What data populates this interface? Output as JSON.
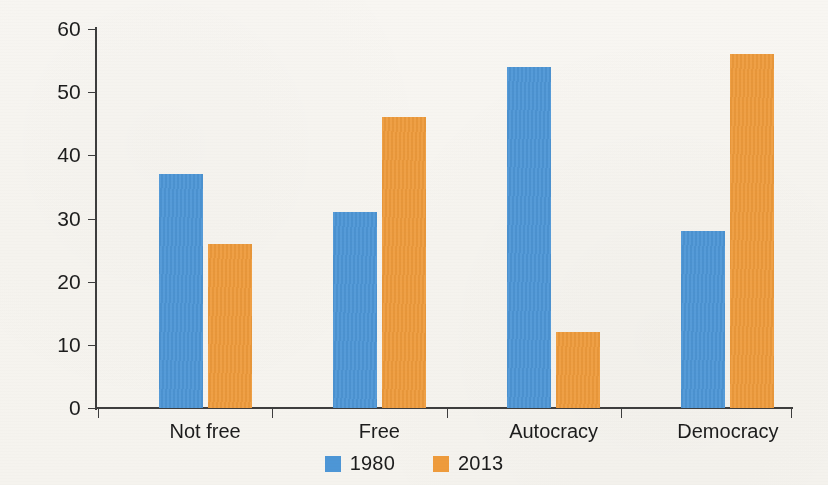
{
  "chart_data": {
    "type": "bar",
    "title": "",
    "subtitle": "",
    "xlabel": "",
    "ylabel": "Percent",
    "categories": [
      "Not free",
      "Free",
      "Autocracy",
      "Democracy"
    ],
    "series": [
      {
        "name": "1980",
        "color": "#4d96d6",
        "values": [
          37,
          31,
          54,
          28
        ]
      },
      {
        "name": "2013",
        "color": "#ee9b3c",
        "values": [
          26,
          46,
          12,
          56
        ]
      }
    ],
    "ylim": [
      0,
      60
    ],
    "yticks": [
      0,
      10,
      20,
      30,
      40,
      50,
      60
    ],
    "ytick_labels": [
      "0",
      "10",
      "20",
      "30",
      "40",
      "50",
      "60"
    ],
    "grid": false,
    "legend_position": "bottom",
    "legend_entries": [
      "1980",
      "2013"
    ]
  },
  "axes": {
    "y_title": "Percent"
  },
  "legend": {
    "items": [
      {
        "label": "1980",
        "swatch": "blue-square-icon"
      },
      {
        "label": "2013",
        "swatch": "orange-square-icon"
      }
    ]
  }
}
